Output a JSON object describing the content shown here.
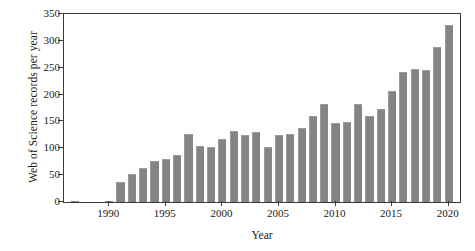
{
  "chart_data": {
    "type": "bar",
    "title": "",
    "xlabel": "Year",
    "ylabel": "Web of Science records per year",
    "xlim": [
      1986,
      2021
    ],
    "ylim": [
      0,
      350
    ],
    "yticks": [
      0,
      50,
      100,
      150,
      200,
      250,
      300,
      350
    ],
    "xticks": [
      1990,
      1995,
      2000,
      2005,
      2010,
      2015,
      2020
    ],
    "grid": false,
    "legend": null,
    "bar_color": "#848484",
    "axis_color": "#3b3b3b",
    "categories": [
      1987,
      1988,
      1989,
      1990,
      1991,
      1992,
      1993,
      1994,
      1995,
      1996,
      1997,
      1998,
      1999,
      2000,
      2001,
      2002,
      2003,
      2004,
      2005,
      2006,
      2007,
      2008,
      2009,
      2010,
      2011,
      2012,
      2013,
      2014,
      2015,
      2016,
      2017,
      2018,
      2019,
      2020
    ],
    "values": [
      1,
      0,
      0,
      1,
      38,
      53,
      64,
      77,
      80,
      88,
      126,
      105,
      102,
      118,
      133,
      125,
      130,
      102,
      124,
      126,
      137,
      160,
      182,
      147,
      149,
      182,
      161,
      174,
      207,
      242,
      247,
      245,
      289,
      330
    ]
  }
}
